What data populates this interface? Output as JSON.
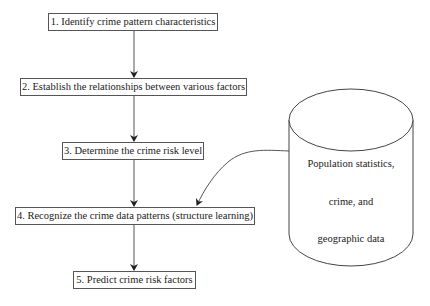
{
  "diagram": {
    "type": "flowchart",
    "steps": [
      {
        "id": 1,
        "label": "1. Identify crime pattern characteristics"
      },
      {
        "id": 2,
        "label": "2. Establish the relationships between various factors"
      },
      {
        "id": 3,
        "label": "3. Determine the crime risk level"
      },
      {
        "id": 4,
        "label": "4. Recognize the crime data patterns (structure learning)"
      },
      {
        "id": 5,
        "label": "5. Predict crime risk factors"
      }
    ],
    "data_source": {
      "shape": "cylinder",
      "lines": [
        "Population statistics,",
        "crime, and",
        "geographic data"
      ],
      "connects_to_step": 4
    },
    "edges": [
      {
        "from": 1,
        "to": 2
      },
      {
        "from": 2,
        "to": 3
      },
      {
        "from": 3,
        "to": 4
      },
      {
        "from": 4,
        "to": 5
      },
      {
        "from": "data_source",
        "to": 4,
        "style": "curved"
      }
    ],
    "colors": {
      "line": "#555555",
      "text": "#222222",
      "background": "#ffffff"
    }
  }
}
